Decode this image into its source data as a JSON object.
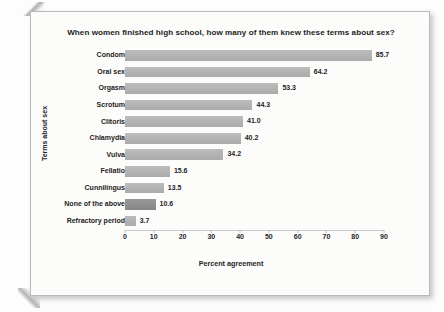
{
  "chart_data": {
    "type": "bar",
    "orientation": "horizontal",
    "title": "When women finished high school, how many of them knew these terms about sex?",
    "xlabel": "Percent agreement",
    "ylabel": "Terms about sex",
    "xlim": [
      0,
      90
    ],
    "xticks": [
      "0",
      "10",
      "20",
      "30",
      "40",
      "50",
      "60",
      "70",
      "80",
      "90"
    ],
    "grid": false,
    "legend": "none",
    "categories": [
      "Condom",
      "Oral sex",
      "Orgasm",
      "Scrotum",
      "Clitoris",
      "Chlamydia",
      "Vulva",
      "Fellatio",
      "Cunnilingus",
      "None of the above",
      "Refractory period"
    ],
    "values": [
      85.7,
      64.2,
      53.3,
      44.3,
      41.0,
      40.2,
      34.2,
      15.6,
      13.5,
      10.6,
      3.7
    ],
    "value_labels": [
      "85.7",
      "64.2",
      "53.3",
      "44.3",
      "41.0",
      "40.2",
      "34.2",
      "15.6",
      "13.5",
      "10.6",
      "3.7"
    ],
    "highlighted_category": "None of the above",
    "colors": {
      "bar": "#b1b1b1",
      "bar_highlight": "#8d8d8d",
      "text": "#222222",
      "page": "#fcfcfb",
      "border": "#b9b9b9"
    }
  }
}
